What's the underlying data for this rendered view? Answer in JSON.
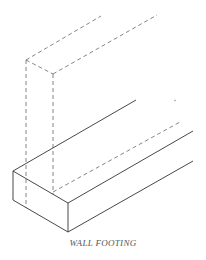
{
  "diagram": {
    "title": "WALL FOOTING",
    "colors": {
      "solid_line": "#333333",
      "hidden_line": "#666666",
      "background": "#ffffff"
    },
    "footing": {
      "label": "footing",
      "style": "solid"
    },
    "wall": {
      "label": "wall",
      "style": "dashed"
    }
  }
}
